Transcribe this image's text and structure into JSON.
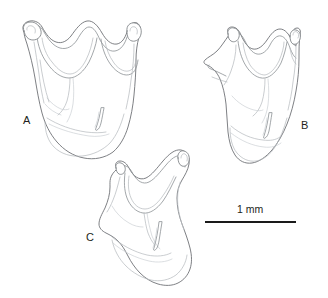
{
  "figure": {
    "background_color": "#ffffff",
    "line_color": "#6f7276",
    "label_color": "#231f20",
    "panels": [
      {
        "id": "A",
        "label": "A",
        "label_x": 27,
        "label_y": 124,
        "description": "line drawing of sclerite, broad bilobed dorsal margin with two rounded apical knobs and deep median notch, tapering rounded ventral end"
      },
      {
        "id": "B",
        "label": "B",
        "label_x": 305,
        "label_y": 129,
        "description": "line drawing of sclerite, narrower bilobed dorsal margin with lateral projection on left side, tapering ventral end"
      },
      {
        "id": "C",
        "label": "C",
        "label_x": 90,
        "label_y": 241,
        "description": "line drawing of sclerite tilted obliquely, single prominent apical knob at upper right, elongate lobed ventral portion"
      }
    ],
    "scale_bar": {
      "label": "1 mm",
      "label_x": 250,
      "label_y": 213,
      "bar_x1": 205,
      "bar_x2": 296,
      "bar_y": 222,
      "bar_color": "#1a1a1a",
      "length_mm": 1
    }
  }
}
